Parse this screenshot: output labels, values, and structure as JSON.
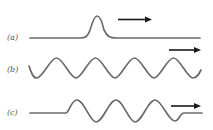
{
  "figure": {
    "colors": {
      "wave": "#6b6b6b",
      "arrow": "#1a1a1a",
      "label": "#555555",
      "background": "#ffffff"
    },
    "panels": [
      {
        "id": "a",
        "label": "(a)",
        "type": "pulse",
        "direction": "right"
      },
      {
        "id": "b",
        "label": "(b)",
        "type": "continuous-sinusoid",
        "direction": "right"
      },
      {
        "id": "c",
        "label": "(c)",
        "type": "wave-train",
        "direction": "right"
      }
    ]
  }
}
